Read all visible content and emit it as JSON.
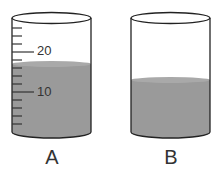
{
  "diagram": {
    "type": "graduated-cylinders",
    "cylinders": [
      {
        "label": "A",
        "graduated": true,
        "scale_labels": [
          "20",
          "10"
        ],
        "liquid_level": 17,
        "liquid_color": "#9a9a9a"
      },
      {
        "label": "B",
        "graduated": false,
        "liquid_color": "#9a9a9a"
      }
    ]
  }
}
